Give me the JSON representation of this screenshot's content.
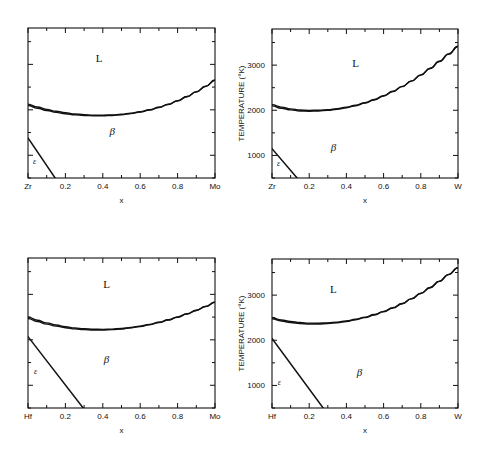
{
  "figure": {
    "background": "#ffffff",
    "line_color": "#111111",
    "panel_count": 4
  },
  "chart_data": [
    {
      "type": "line",
      "id": "zr-mo",
      "title": "",
      "xlabel": "x",
      "ylabel": "",
      "left_component": "Zr",
      "right_component": "Mo",
      "xlim": [
        0,
        1
      ],
      "ylim": [
        500,
        3800
      ],
      "xticks": [
        0,
        0.2,
        0.4,
        0.6,
        0.8,
        1.0
      ],
      "xticklabels": [
        "Zr",
        "0.2",
        "0.4",
        "0.6",
        "0.8",
        "Mo"
      ],
      "yticks": [
        1000,
        2000,
        3000
      ],
      "yticklabels": [
        "",
        "",
        ""
      ],
      "grid": false,
      "legend": "none",
      "annotations": [
        {
          "text": "L",
          "x": 0.38,
          "y": 3050
        },
        {
          "text": "β",
          "x": 0.45,
          "y": 1450
        },
        {
          "text": "ε",
          "x": 0.035,
          "y": 800
        }
      ],
      "series": [
        {
          "name": "liquidus",
          "x": [
            0.0,
            0.05,
            0.1,
            0.15,
            0.2,
            0.25,
            0.3,
            0.35,
            0.4,
            0.45,
            0.5,
            0.55,
            0.6,
            0.65,
            0.7,
            0.75,
            0.8,
            0.85,
            0.9,
            0.95,
            1.0
          ],
          "y": [
            2125,
            2062,
            2010,
            1968,
            1935,
            1910,
            1893,
            1884,
            1882,
            1888,
            1903,
            1926,
            1959,
            2002,
            2056,
            2122,
            2200,
            2292,
            2398,
            2519,
            2655
          ]
        },
        {
          "name": "solidus",
          "x": [
            0.0,
            0.05,
            0.1,
            0.15,
            0.2,
            0.25,
            0.3,
            0.35,
            0.4,
            0.45,
            0.5,
            0.55,
            0.6,
            0.65,
            0.7,
            0.75,
            0.8,
            0.85,
            0.9,
            0.95,
            1.0
          ],
          "y": [
            2095,
            2034,
            1984,
            1944,
            1913,
            1890,
            1875,
            1868,
            1868,
            1876,
            1892,
            1917,
            1951,
            1995,
            2050,
            2117,
            2196,
            2288,
            2394,
            2515,
            2651
          ]
        },
        {
          "name": "epsilon-beta-boundary",
          "x": [
            0.0,
            0.145
          ],
          "y": [
            1380,
            500
          ]
        }
      ]
    },
    {
      "type": "line",
      "id": "zr-w",
      "title": "",
      "xlabel": "x",
      "ylabel": "TEMPERATURE  (°K)",
      "left_component": "Zr",
      "right_component": "W",
      "xlim": [
        0,
        1
      ],
      "ylim": [
        500,
        3800
      ],
      "xticks": [
        0,
        0.2,
        0.4,
        0.6,
        0.8,
        1.0
      ],
      "xticklabels": [
        "Zr",
        "0.2",
        "0.4",
        "0.6",
        "0.8",
        "W"
      ],
      "yticks": [
        1000,
        2000,
        3000
      ],
      "yticklabels": [
        "1000",
        "2000",
        "3000"
      ],
      "grid": false,
      "legend": "none",
      "annotations": [
        {
          "text": "L",
          "x": 0.45,
          "y": 2950
        },
        {
          "text": "β",
          "x": 0.33,
          "y": 1100
        },
        {
          "text": "ε",
          "x": 0.035,
          "y": 760
        }
      ],
      "series": [
        {
          "name": "liquidus",
          "x": [
            0.0,
            0.05,
            0.1,
            0.15,
            0.2,
            0.25,
            0.3,
            0.35,
            0.4,
            0.45,
            0.5,
            0.55,
            0.6,
            0.65,
            0.7,
            0.75,
            0.8,
            0.85,
            0.9,
            0.95,
            1.0
          ],
          "y": [
            2125,
            2070,
            2030,
            2005,
            1998,
            2000,
            2012,
            2035,
            2068,
            2112,
            2168,
            2238,
            2322,
            2420,
            2530,
            2652,
            2785,
            2930,
            3085,
            3250,
            3420
          ]
        },
        {
          "name": "solidus",
          "x": [
            0.0,
            0.05,
            0.1,
            0.15,
            0.2,
            0.25,
            0.3,
            0.35,
            0.4,
            0.45,
            0.5,
            0.55,
            0.6,
            0.65,
            0.7,
            0.75,
            0.8,
            0.85,
            0.9,
            0.95,
            1.0
          ],
          "y": [
            2098,
            2046,
            2008,
            1985,
            1980,
            1984,
            1998,
            2022,
            2056,
            2101,
            2158,
            2229,
            2314,
            2413,
            2524,
            2646,
            2779,
            2924,
            3079,
            3244,
            3414
          ]
        },
        {
          "name": "epsilon-beta-boundary",
          "x": [
            0.0,
            0.135
          ],
          "y": [
            1150,
            500
          ]
        }
      ]
    },
    {
      "type": "line",
      "id": "hf-mo",
      "title": "",
      "xlabel": "x",
      "ylabel": "",
      "left_component": "Hf",
      "right_component": "Mo",
      "xlim": [
        0,
        1
      ],
      "ylim": [
        500,
        3800
      ],
      "xticks": [
        0,
        0.2,
        0.4,
        0.6,
        0.8,
        1.0
      ],
      "xticklabels": [
        "Hf",
        "0.2",
        "0.4",
        "0.6",
        "0.8",
        "Mo"
      ],
      "yticks": [
        1000,
        2000,
        3000
      ],
      "yticklabels": [
        "",
        "",
        ""
      ],
      "grid": false,
      "legend": "none",
      "annotations": [
        {
          "text": "L",
          "x": 0.42,
          "y": 3150
        },
        {
          "text": "β",
          "x": 0.42,
          "y": 1500
        },
        {
          "text": "ε",
          "x": 0.04,
          "y": 1250
        }
      ],
      "series": [
        {
          "name": "liquidus",
          "x": [
            0.0,
            0.05,
            0.1,
            0.15,
            0.2,
            0.25,
            0.3,
            0.35,
            0.4,
            0.45,
            0.5,
            0.55,
            0.6,
            0.65,
            0.7,
            0.75,
            0.8,
            0.85,
            0.9,
            0.95,
            1.0
          ],
          "y": [
            2500,
            2430,
            2372,
            2325,
            2288,
            2260,
            2242,
            2232,
            2230,
            2236,
            2250,
            2272,
            2302,
            2340,
            2386,
            2440,
            2502,
            2572,
            2650,
            2736,
            2830
          ]
        },
        {
          "name": "solidus",
          "x": [
            0.0,
            0.05,
            0.1,
            0.15,
            0.2,
            0.25,
            0.3,
            0.35,
            0.4,
            0.45,
            0.5,
            0.55,
            0.6,
            0.65,
            0.7,
            0.75,
            0.8,
            0.85,
            0.9,
            0.95,
            1.0
          ],
          "y": [
            2470,
            2402,
            2346,
            2301,
            2266,
            2240,
            2224,
            2216,
            2216,
            2224,
            2239,
            2262,
            2294,
            2333,
            2380,
            2435,
            2498,
            2568,
            2646,
            2732,
            2826
          ]
        },
        {
          "name": "epsilon-beta-boundary",
          "x": [
            0.0,
            0.295
          ],
          "y": [
            2070,
            500
          ]
        }
      ]
    },
    {
      "type": "line",
      "id": "hf-w",
      "title": "",
      "xlabel": "x",
      "ylabel": "TEMPERATURE  (°K)",
      "left_component": "Hf",
      "right_component": "W",
      "xlim": [
        0,
        1
      ],
      "ylim": [
        500,
        3800
      ],
      "xticks": [
        0,
        0.2,
        0.4,
        0.6,
        0.8,
        1.0
      ],
      "xticklabels": [
        "Hf",
        "0.2",
        "0.4",
        "0.6",
        "0.8",
        "W"
      ],
      "yticks": [
        1000,
        2000,
        3000
      ],
      "yticklabels": [
        "1000",
        "2000",
        "3000"
      ],
      "grid": false,
      "legend": "none",
      "annotations": [
        {
          "text": "L",
          "x": 0.33,
          "y": 3050
        },
        {
          "text": "β",
          "x": 0.47,
          "y": 1200
        },
        {
          "text": "ε",
          "x": 0.04,
          "y": 1000
        }
      ],
      "series": [
        {
          "name": "liquidus",
          "x": [
            0.0,
            0.05,
            0.1,
            0.15,
            0.2,
            0.25,
            0.3,
            0.35,
            0.4,
            0.45,
            0.5,
            0.55,
            0.6,
            0.65,
            0.7,
            0.75,
            0.8,
            0.85,
            0.9,
            0.95,
            1.0
          ],
          "y": [
            2500,
            2450,
            2415,
            2392,
            2380,
            2378,
            2385,
            2402,
            2428,
            2465,
            2512,
            2570,
            2640,
            2722,
            2816,
            2922,
            3040,
            3170,
            3310,
            3460,
            3610
          ]
        },
        {
          "name": "solidus",
          "x": [
            0.0,
            0.05,
            0.1,
            0.15,
            0.2,
            0.25,
            0.3,
            0.35,
            0.4,
            0.45,
            0.5,
            0.55,
            0.6,
            0.65,
            0.7,
            0.75,
            0.8,
            0.85,
            0.9,
            0.95,
            1.0
          ],
          "y": [
            2474,
            2426,
            2393,
            2372,
            2362,
            2362,
            2370,
            2388,
            2415,
            2453,
            2501,
            2560,
            2631,
            2714,
            2809,
            2916,
            3034,
            3164,
            3305,
            3455,
            3605
          ]
        },
        {
          "name": "epsilon-beta-boundary",
          "x": [
            0.0,
            0.275
          ],
          "y": [
            2040,
            500
          ]
        }
      ]
    }
  ]
}
